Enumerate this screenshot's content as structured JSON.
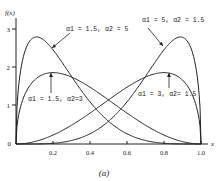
{
  "chart_data": {
    "type": "line",
    "title": "",
    "caption": "(a)",
    "xlabel": "x",
    "ylabel": "f(x)",
    "xlim": [
      0,
      1.0
    ],
    "ylim": [
      0,
      3.2
    ],
    "xticks": [
      "0.2",
      "0.4",
      "0.6",
      "0.8",
      "1.0"
    ],
    "yticks": [
      "0",
      "1",
      "2",
      "3"
    ],
    "grid": false,
    "legend": "annotations",
    "series": [
      {
        "name": "α1 = 1.5, α2 = 5",
        "a1": 1.5,
        "a2": 5,
        "peak_x": 0.11,
        "peak_y": 2.8
      },
      {
        "name": "α1 = 5, α2 = 1.5",
        "a1": 5,
        "a2": 1.5,
        "peak_x": 0.89,
        "peak_y": 2.8
      },
      {
        "name": "α1 = 1.5, α2 = 3",
        "a1": 1.5,
        "a2": 3,
        "peak_x": 0.2,
        "peak_y": 1.86
      },
      {
        "name": "α1 = 3, α2 = 1.5",
        "a1": 3,
        "a2": 1.5,
        "peak_x": 0.8,
        "peak_y": 1.86
      }
    ]
  },
  "labels": {
    "ylabel": "f(x)",
    "xlabel": "x",
    "caption": "(a)",
    "ann1": "α1 = 1.5, α2 = 5",
    "ann2": "α1 = 5, α2 = 1.5",
    "ann3": "α1 = 1.5, α2=3",
    "ann4": "α1 = 3, α2= 1.5",
    "x0": "0",
    "y0": "0",
    "y1": "1",
    "y2": "2",
    "y3": "3",
    "x02": "0.2",
    "x04": "0.4",
    "x06": "0.6",
    "x08": "0.8",
    "x10": "1.0"
  }
}
